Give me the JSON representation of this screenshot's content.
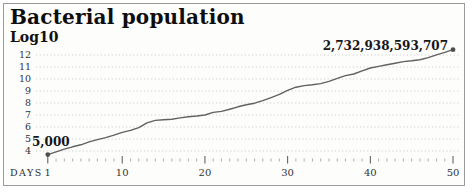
{
  "frame": {
    "background": "#fdfdfc",
    "border_color": "#9b9b9b"
  },
  "colors": {
    "line": "#616161",
    "endpoint_dot": "#4e4e4e",
    "grid": "#cfcfcf",
    "minor_tick": "#9a9a9a",
    "major_tick": "#555555",
    "tick_label": "#333333",
    "y_label": "#333333",
    "title_text": "#0d0d0d"
  },
  "chart_data": {
    "type": "line",
    "title": "Bacterial population",
    "subtitle_scale_label": "Log10",
    "xlabel": "DAYS",
    "legend": "none",
    "grid": "horizontal-dotted",
    "x_range": [
      1,
      50
    ],
    "x_major_ticks": [
      1,
      10,
      20,
      30,
      40,
      50
    ],
    "x_minor_tick_step": 1,
    "y_ticks": [
      4,
      5,
      6,
      7,
      8,
      9,
      10,
      11,
      12
    ],
    "ylim": [
      3.4,
      12.7
    ],
    "days": [
      1,
      2,
      3,
      4,
      5,
      6,
      7,
      8,
      9,
      10,
      11,
      12,
      13,
      14,
      15,
      16,
      17,
      18,
      19,
      20,
      21,
      22,
      23,
      24,
      25,
      26,
      27,
      28,
      29,
      30,
      31,
      32,
      33,
      34,
      35,
      36,
      37,
      38,
      39,
      40,
      41,
      42,
      43,
      44,
      45,
      46,
      47,
      48,
      49,
      50
    ],
    "log10_population": [
      3.7,
      3.93,
      4.15,
      4.35,
      4.52,
      4.76,
      4.95,
      5.12,
      5.32,
      5.55,
      5.72,
      5.95,
      6.35,
      6.55,
      6.6,
      6.65,
      6.76,
      6.85,
      6.92,
      7.0,
      7.22,
      7.3,
      7.48,
      7.68,
      7.85,
      7.98,
      8.2,
      8.45,
      8.72,
      9.05,
      9.32,
      9.45,
      9.52,
      9.62,
      9.8,
      10.05,
      10.28,
      10.42,
      10.68,
      10.92,
      11.05,
      11.18,
      11.32,
      11.45,
      11.52,
      11.6,
      11.78,
      12.02,
      12.22,
      12.44
    ],
    "start_point": {
      "day": 1,
      "label": "5,000",
      "log10": 3.7
    },
    "end_point": {
      "day": 50,
      "label": "2,732,938,593,707",
      "log10": 12.44
    }
  }
}
